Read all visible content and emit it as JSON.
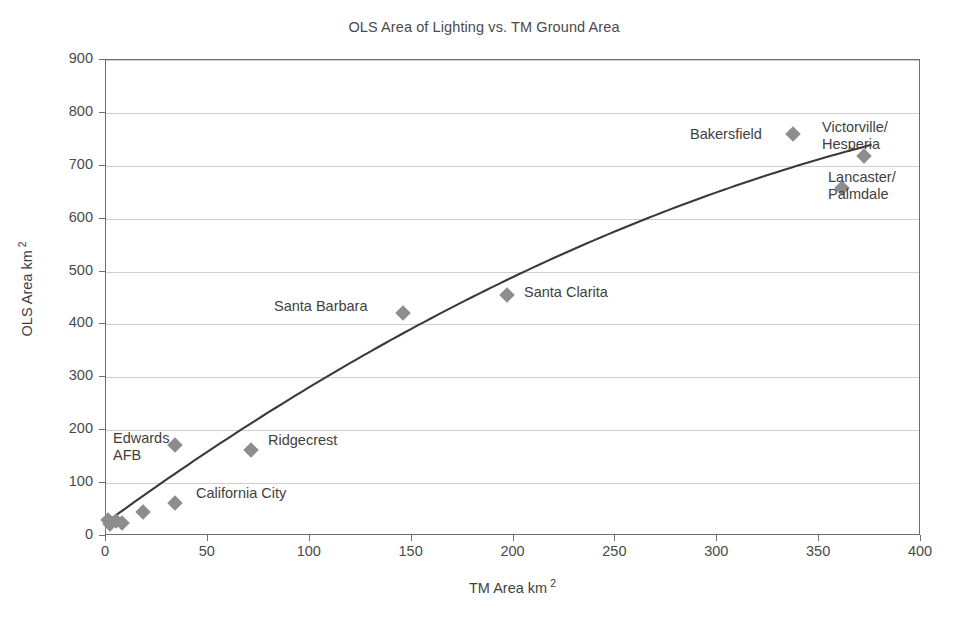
{
  "chart_data": {
    "type": "scatter",
    "title": "OLS Area of Lighting vs. TM Ground Area",
    "xlabel": "TM Area km",
    "xlabel_sup": "2",
    "ylabel": "OLS Area km",
    "ylabel_sup": "2",
    "xlim": [
      0,
      400
    ],
    "ylim": [
      0,
      900
    ],
    "xticks": [
      0,
      50,
      100,
      150,
      200,
      250,
      300,
      350,
      400
    ],
    "yticks": [
      0,
      100,
      200,
      300,
      400,
      500,
      600,
      700,
      800,
      900
    ],
    "grid": "horizontal",
    "legend": "none",
    "marker_color": "#8d8d8d",
    "marker_shape": "diamond",
    "trendline_color": "#3a3a3a",
    "annotations": {
      "equation": "y = − 0.0024x² +  2.8075x +  21.953",
      "equation_line1_parts": {
        "lhs": "y = − 0.0024x",
        "sup": "2",
        "rhs": " +  2.8075x +  21.953"
      },
      "r_squared_prefix": "R",
      "r_squared_sup": "2",
      "r_squared_value": " = 0.9812"
    },
    "fit": {
      "model": "quadratic",
      "a": -0.0024,
      "b": 2.8075,
      "c": 21.953,
      "r_squared": 0.9812
    },
    "points": [
      {
        "label": "",
        "x": 1,
        "y": 30
      },
      {
        "label": "",
        "x": 2,
        "y": 22
      },
      {
        "label": "",
        "x": 5,
        "y": 28
      },
      {
        "label": "",
        "x": 8,
        "y": 25
      },
      {
        "label": "",
        "x": 18,
        "y": 45
      },
      {
        "label": "California City",
        "x": 34,
        "y": 62
      },
      {
        "label": "Edwards AFB",
        "x": 34,
        "y": 172
      },
      {
        "label": "Ridgecrest",
        "x": 71,
        "y": 163
      },
      {
        "label": "Santa Barbara",
        "x": 146,
        "y": 422
      },
      {
        "label": "Santa Clarita",
        "x": 197,
        "y": 456
      },
      {
        "label": "Bakersfield",
        "x": 337,
        "y": 760
      },
      {
        "label": "Lancaster/Palmdale",
        "x": 361,
        "y": 658
      },
      {
        "label": "Victorville/Hesperia",
        "x": 372,
        "y": 718
      }
    ],
    "point_labels": [
      {
        "name": "edwards-afb",
        "text": "Edwards\nAFB",
        "left": 113,
        "top": 430,
        "align": "left"
      },
      {
        "name": "ridgecrest",
        "text": "Ridgecrest",
        "left": 268,
        "top": 432,
        "align": "left"
      },
      {
        "name": "california-city",
        "text": "California City",
        "left": 196,
        "top": 485,
        "align": "left"
      },
      {
        "name": "santa-barbara",
        "text": "Santa Barbara",
        "left": 274,
        "top": 298,
        "align": "left"
      },
      {
        "name": "santa-clarita",
        "text": "Santa Clarita",
        "left": 524,
        "top": 284,
        "align": "left"
      },
      {
        "name": "bakersfield",
        "text": "Bakersfield",
        "left": 690,
        "top": 126,
        "align": "left"
      },
      {
        "name": "victorville-hesperia",
        "text": "Victorville/\nHesperia",
        "left": 822,
        "top": 119,
        "align": "left"
      },
      {
        "name": "lancaster-palmdale",
        "text": "Lancaster/\nPalmdale",
        "left": 828,
        "top": 169,
        "align": "left"
      }
    ]
  }
}
